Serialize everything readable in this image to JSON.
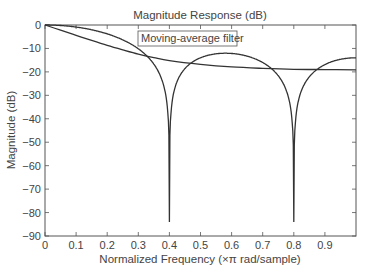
{
  "chart_data": {
    "type": "line",
    "title": "Magnitude Response (dB)",
    "xlabel": "Normalized Frequency (×π rad/sample)",
    "ylabel": "Magnitude (dB)",
    "xlim": [
      0,
      1
    ],
    "ylim": [
      -90,
      0
    ],
    "xticks": [
      "0",
      "0.1",
      "0.2",
      "0.3",
      "0.4",
      "0.5",
      "0.6",
      "0.7",
      "0.8",
      "0.9"
    ],
    "yticks": [
      "0",
      "−10",
      "−20",
      "−30",
      "−40",
      "−50",
      "−60",
      "−70",
      "−80",
      "−90"
    ],
    "grid": false,
    "annotation": "Moving-average filter",
    "series": [
      {
        "name": "Moving-average filter (N=5)",
        "x": [
          0,
          0.05,
          0.1,
          0.15,
          0.2,
          0.25,
          0.3,
          0.35,
          0.38,
          0.4,
          0.42,
          0.45,
          0.5,
          0.55,
          0.58,
          0.6,
          0.65,
          0.7,
          0.75,
          0.78,
          0.8,
          0.82,
          0.85,
          0.9,
          0.95,
          1.0
        ],
        "values": [
          0,
          -0.4,
          -1.6,
          -3.7,
          -6.6,
          -10.4,
          -15.8,
          -24.5,
          -35,
          -84,
          -35,
          -22.5,
          -15.5,
          -12.9,
          -12.5,
          -12.6,
          -13.8,
          -16.8,
          -23.4,
          -33,
          -83,
          -32,
          -22,
          -16.5,
          -14.5,
          -14
        ]
      },
      {
        "name": "Smooth lowpass",
        "x": [
          0,
          0.05,
          0.1,
          0.15,
          0.2,
          0.25,
          0.3,
          0.35,
          0.4,
          0.5,
          0.6,
          0.7,
          0.8,
          0.9,
          1.0
        ],
        "values": [
          0,
          -2.2,
          -4.4,
          -6.6,
          -8.7,
          -10.6,
          -12.4,
          -13.9,
          -15.2,
          -16.8,
          -17.9,
          -18.5,
          -18.9,
          -19.0,
          -19.1
        ]
      }
    ]
  }
}
